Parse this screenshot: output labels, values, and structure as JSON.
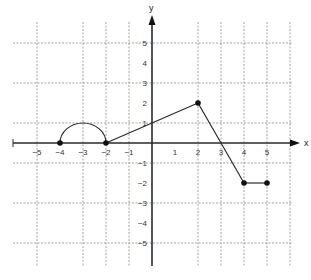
{
  "chart_data": {
    "type": "line",
    "title": "",
    "xlabel": "x",
    "ylabel": "y",
    "xlim": [
      -5.5,
      6
    ],
    "ylim": [
      -6,
      6
    ],
    "x_ticks": [
      -5,
      -4,
      -3,
      -2,
      -1,
      1,
      2,
      3,
      4,
      5
    ],
    "x_tick_labels": [
      "−5",
      "−4",
      "−3",
      "−2",
      "−1",
      "1",
      "2",
      "3",
      "4",
      "5"
    ],
    "y_ticks": [
      5,
      4,
      3,
      2,
      1,
      -1,
      -2,
      -3,
      -4,
      -5
    ],
    "y_tick_labels": [
      "5",
      "4",
      "3",
      "2",
      "1",
      "−1",
      "−2",
      "−3",
      "−4",
      "−5"
    ],
    "grid": {
      "on": true,
      "style": "dashed",
      "vertical_x": [
        -5,
        -3,
        -2,
        -1,
        2,
        3,
        4,
        5,
        6
      ],
      "horizontal_y": [
        5,
        3,
        1,
        -1,
        -3,
        -5
      ]
    },
    "series": [
      {
        "name": "f(x)",
        "segments": [
          {
            "kind": "semicircle",
            "center": [
              -3,
              0
            ],
            "radius": 1,
            "from": [
              -4,
              0
            ],
            "to": [
              -2,
              0
            ],
            "top": [
              -3,
              1
            ]
          },
          {
            "kind": "line",
            "points": [
              [
                -2,
                0
              ],
              [
                2,
                2
              ]
            ]
          },
          {
            "kind": "line",
            "points": [
              [
                2,
                2
              ],
              [
                4,
                -2
              ]
            ]
          },
          {
            "kind": "line",
            "points": [
              [
                4,
                -2
              ],
              [
                5,
                -2
              ]
            ]
          }
        ],
        "marked_points": [
          [
            -4,
            0
          ],
          [
            -2,
            0
          ],
          [
            2,
            2
          ],
          [
            4,
            -2
          ],
          [
            5,
            -2
          ]
        ]
      }
    ],
    "legend": null
  }
}
